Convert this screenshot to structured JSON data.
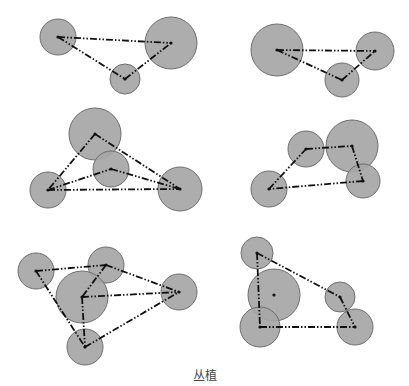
{
  "caption": "丛植",
  "style": {
    "circle_fill": "#a6a6a6",
    "circle_stroke": "#6e6e6e",
    "line_color": "#111111"
  },
  "diagrams": [
    {
      "name": "group-3-top-left",
      "circles": [
        {
          "cx": 58,
          "cy": 37,
          "r": 18
        },
        {
          "cx": 171,
          "cy": 43,
          "r": 26
        },
        {
          "cx": 125,
          "cy": 79,
          "r": 15
        }
      ],
      "links": [
        [
          0,
          1
        ],
        [
          0,
          2
        ],
        [
          2,
          1
        ]
      ]
    },
    {
      "name": "group-3-top-right",
      "circles": [
        {
          "cx": 277,
          "cy": 50,
          "r": 26
        },
        {
          "cx": 375,
          "cy": 51,
          "r": 19
        },
        {
          "cx": 342,
          "cy": 80,
          "r": 17
        }
      ],
      "links": [
        [
          0,
          1
        ],
        [
          0,
          2
        ],
        [
          2,
          1
        ]
      ]
    },
    {
      "name": "group-4-middle-left",
      "circles": [
        {
          "cx": 95,
          "cy": 134,
          "r": 26
        },
        {
          "cx": 111,
          "cy": 169,
          "r": 18
        },
        {
          "cx": 48,
          "cy": 190,
          "r": 18
        },
        {
          "cx": 180,
          "cy": 189,
          "r": 22
        }
      ],
      "links": [
        [
          0,
          2
        ],
        [
          0,
          3
        ],
        [
          2,
          1
        ],
        [
          1,
          3
        ],
        [
          2,
          3
        ]
      ]
    },
    {
      "name": "group-4-middle-right",
      "circles": [
        {
          "cx": 306,
          "cy": 149,
          "r": 18
        },
        {
          "cx": 352,
          "cy": 146,
          "r": 26
        },
        {
          "cx": 363,
          "cy": 181,
          "r": 17
        },
        {
          "cx": 269,
          "cy": 189,
          "r": 18
        }
      ],
      "links": [
        [
          3,
          0
        ],
        [
          0,
          1
        ],
        [
          1,
          2
        ],
        [
          2,
          3
        ]
      ]
    },
    {
      "name": "group-5-bottom-left",
      "circles": [
        {
          "cx": 36,
          "cy": 271,
          "r": 18
        },
        {
          "cx": 106,
          "cy": 265,
          "r": 18
        },
        {
          "cx": 82,
          "cy": 297,
          "r": 26
        },
        {
          "cx": 179,
          "cy": 292,
          "r": 18
        },
        {
          "cx": 85,
          "cy": 347,
          "r": 18
        }
      ],
      "links": [
        [
          0,
          1
        ],
        [
          1,
          3
        ],
        [
          0,
          4
        ],
        [
          4,
          3
        ],
        [
          1,
          2
        ],
        [
          2,
          3
        ],
        [
          2,
          4
        ]
      ]
    },
    {
      "name": "group-5-bottom-right",
      "circles": [
        {
          "cx": 257,
          "cy": 253,
          "r": 16
        },
        {
          "cx": 274,
          "cy": 295,
          "r": 26
        },
        {
          "cx": 340,
          "cy": 297,
          "r": 15
        },
        {
          "cx": 260,
          "cy": 327,
          "r": 20
        },
        {
          "cx": 355,
          "cy": 327,
          "r": 18
        }
      ],
      "links": [
        [
          0,
          2
        ],
        [
          2,
          4
        ],
        [
          0,
          3
        ],
        [
          3,
          4
        ]
      ],
      "isolated_dot": 1
    }
  ]
}
